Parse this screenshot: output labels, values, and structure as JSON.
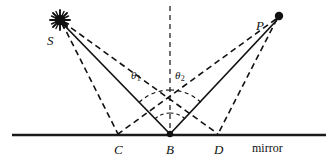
{
  "figure": {
    "labels": {
      "source": "S",
      "observer": "P",
      "point_c": "C",
      "point_b": "B",
      "point_d": "D",
      "theta_1": "θ",
      "theta_1_sub": "1",
      "theta_2": "θ",
      "theta_2_sub": "2",
      "mirror": "mirror"
    },
    "colors": {
      "ink": "#111111",
      "mirror_line": "#1a1a1a",
      "background": "#ffffff"
    },
    "geometry": {
      "source_point": [
        60,
        20
      ],
      "observer_point": [
        279,
        16
      ],
      "reflection_point_b": [
        170,
        135
      ],
      "point_c": [
        118,
        135
      ],
      "point_d": [
        218,
        135
      ],
      "mirror_y": 135,
      "mirror_x_start": 12,
      "mirror_x_end": 326,
      "normal_top": [
        170,
        6
      ],
      "normal_bottom": [
        170,
        135
      ]
    },
    "elements": {
      "solid_rays": [
        "S-B",
        "P-B"
      ],
      "dashed_rays": [
        "S-C",
        "S-D",
        "P-C",
        "P-D"
      ],
      "dashed_normal": "B-up",
      "angle_arcs": [
        "theta1 at B between normal and BS",
        "theta2 at B between normal and BP"
      ]
    }
  }
}
